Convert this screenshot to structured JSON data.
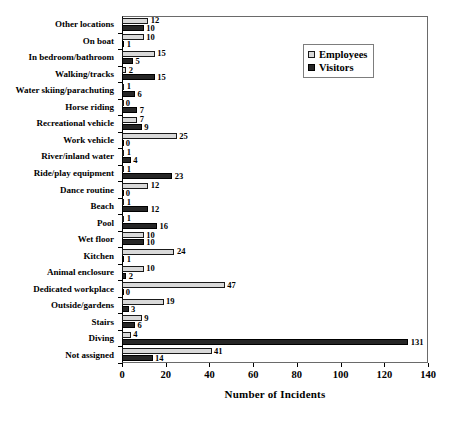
{
  "chart_data": {
    "type": "bar",
    "orientation": "horizontal",
    "title": "",
    "xlabel": "Number of Incidents",
    "ylabel": "",
    "xlim": [
      0,
      140
    ],
    "xticks": [
      0,
      20,
      40,
      60,
      80,
      100,
      120,
      140
    ],
    "grid": false,
    "legend_position": "top-right",
    "categories": [
      "Other locations",
      "On boat",
      "In bedroom/bathroom",
      "Walking/tracks",
      "Water skiing/parachuting",
      "Horse riding",
      "Recreational vehicle",
      "Work vehicle",
      "River/inland water",
      "Ride/play equipment",
      "Dance routine",
      "Beach",
      "Pool",
      "Wet floor",
      "Kitchen",
      "Animal enclosure",
      "Dedicated workplace",
      "Outside/gardens",
      "Stairs",
      "Diving",
      "Not assigned"
    ],
    "series": [
      {
        "name": "Employees",
        "color": "#d9d9d9",
        "values": [
          12,
          10,
          15,
          2,
          1,
          0,
          7,
          25,
          1,
          1,
          12,
          1,
          1,
          10,
          24,
          10,
          47,
          19,
          9,
          4,
          41
        ]
      },
      {
        "name": "Visitors",
        "color": "#262626",
        "values": [
          10,
          1,
          5,
          15,
          6,
          7,
          9,
          0,
          4,
          23,
          0,
          12,
          16,
          10,
          1,
          2,
          0,
          3,
          6,
          131,
          14
        ]
      }
    ]
  },
  "legend": {
    "items": [
      {
        "label": "Employees",
        "swatch": "light-square-swatch"
      },
      {
        "label": "Visitors",
        "swatch": "dark-square-swatch"
      }
    ]
  }
}
